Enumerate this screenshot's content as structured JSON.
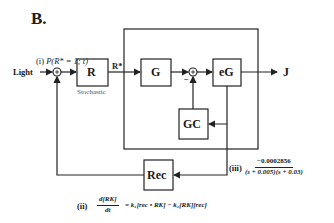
{
  "panel_label": "B.",
  "input": {
    "label": "Light"
  },
  "output": {
    "label": "J"
  },
  "blocks": {
    "R": {
      "label": "R",
      "caption": "Stochastic"
    },
    "G": {
      "label": "G"
    },
    "eG": {
      "label": "eG"
    },
    "GC": {
      "label": "GC"
    },
    "Rec": {
      "label": "Rec"
    }
  },
  "signals": {
    "r_star": "R*"
  },
  "summing_junctions": [
    {
      "id": "sum1",
      "symbol": "+"
    },
    {
      "id": "sum2",
      "symbol": "+",
      "minus_label": "−"
    }
  ],
  "equations": {
    "i": {
      "tag": "(i)",
      "text": "P(R* = 1; t)"
    },
    "ii": {
      "tag": "(ii)",
      "lhs_num": "d[RK]",
      "lhs_den": "dt",
      "rhs": "= k₁[rec • RK] − k₂[RK][rec]"
    },
    "iii": {
      "tag": "(iii)",
      "numerator": "−0.0002856",
      "denominator": "(s + 0.005)(s + 0.03)"
    }
  },
  "colors": {
    "line": "#222222",
    "text": "#1a1a1a",
    "caption": "#555555",
    "background": "#ffffff"
  }
}
